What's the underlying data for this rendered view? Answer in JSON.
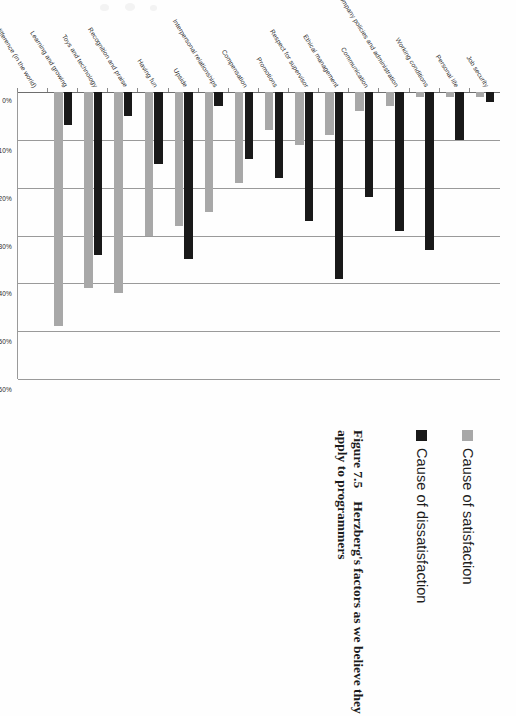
{
  "figure": {
    "number": "Figure 7.5",
    "caption": "Herzberg's factors as we believe they apply to programmers"
  },
  "legend": {
    "position": "right",
    "items": [
      {
        "label": "Cause of satisfaction",
        "color": "#a8a8a8",
        "key": "satisfaction"
      },
      {
        "label": "Cause of dissatisfaction",
        "color": "#191919",
        "key": "dissatisfaction"
      }
    ]
  },
  "axis": {
    "ticks": [
      "0%",
      "10%",
      "20%",
      "30%",
      "40%",
      "50%",
      "60%"
    ],
    "min": 0,
    "max": 60
  },
  "chart_data": {
    "type": "bar",
    "orientation": "horizontal",
    "title": "",
    "xlabel": "",
    "ylabel": "",
    "xlim": [
      0,
      60
    ],
    "grid": true,
    "legend_position": "right",
    "categories": [
      "Job security",
      "Personal life",
      "Working conditions",
      "Company policies and administration",
      "Communication",
      "Ethical management",
      "Respect for supervisor",
      "Promotions",
      "Compensation",
      "Interpersonal relationships",
      "Upside",
      "Having fun",
      "Recognition and praise",
      "Toys and technology",
      "Learning and growing",
      "Making a difference (in the world)"
    ],
    "series": [
      {
        "name": "Cause of dissatisfaction",
        "color": "#191919",
        "values": [
          2,
          10,
          33,
          29,
          22,
          39,
          27,
          18,
          14,
          3,
          35,
          15,
          5,
          34,
          7,
          0
        ]
      },
      {
        "name": "Cause of satisfaction",
        "color": "#a8a8a8",
        "values": [
          1,
          1,
          1,
          3,
          4,
          9,
          11,
          8,
          19,
          25,
          28,
          30,
          42,
          41,
          49,
          0
        ]
      }
    ]
  }
}
